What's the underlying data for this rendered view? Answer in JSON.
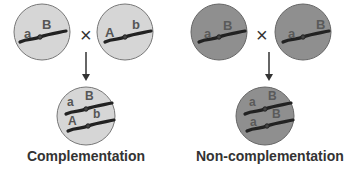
{
  "panels": [
    {
      "caption": "Complementation",
      "cell_fill": "#d6d6d6",
      "letter_color": "#555555",
      "parents": [
        {
          "labels": [
            "a",
            "B"
          ]
        },
        {
          "labels": [
            "A",
            "b"
          ]
        }
      ],
      "cross_symbol": "×",
      "offspring": {
        "labels_top": [
          "a",
          "B"
        ],
        "labels_bottom": [
          "A",
          "b"
        ]
      }
    },
    {
      "caption": "Non-complementation",
      "cell_fill": "#8f8f8f",
      "letter_color": "#5a5a5a",
      "parents": [
        {
          "labels": [
            "a",
            "B"
          ]
        },
        {
          "labels": [
            "a",
            "B"
          ]
        }
      ],
      "cross_symbol": "×",
      "offspring": {
        "labels_top": [
          "a",
          "B"
        ],
        "labels_bottom": [
          "a",
          "B"
        ]
      }
    }
  ],
  "colors": {
    "chromosome": "#222222",
    "cell_outline": "#777777",
    "arrow": "#333333"
  }
}
